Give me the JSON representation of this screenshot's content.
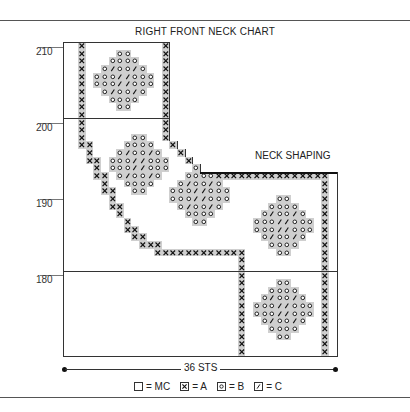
{
  "title": "RIGHT FRONT NECK CHART",
  "annotation": "NECK SHAPING",
  "width_label": "36 STS",
  "y_axis": {
    "labels": [
      {
        "value": "210",
        "y": 49
      },
      {
        "value": "200",
        "y": 125
      },
      {
        "value": "190",
        "y": 201
      },
      {
        "value": "180",
        "y": 277
      }
    ]
  },
  "legend": [
    {
      "symbol": "MC",
      "text": "= MC"
    },
    {
      "symbol": "A",
      "text": "= A"
    },
    {
      "symbol": "B",
      "text": "= B"
    },
    {
      "symbol": "C",
      "text": "= C"
    }
  ],
  "grid": {
    "columns": 36,
    "rows": 41,
    "cell_w": 7.6,
    "cell_h": 7.65,
    "row_widths": [
      14,
      14,
      14,
      14,
      14,
      14,
      14,
      14,
      14,
      14,
      14,
      14,
      14,
      15,
      16,
      17,
      18,
      36,
      36,
      36,
      36,
      36,
      36,
      36,
      36,
      36,
      36,
      36,
      36,
      36,
      36,
      36,
      36,
      36,
      36,
      36,
      36,
      36,
      36,
      36,
      36
    ],
    "a_cells": [
      [
        0,
        2
      ],
      [
        1,
        2
      ],
      [
        2,
        2
      ],
      [
        3,
        2
      ],
      [
        4,
        2
      ],
      [
        5,
        2
      ],
      [
        6,
        2
      ],
      [
        7,
        2
      ],
      [
        8,
        2
      ],
      [
        9,
        2
      ],
      [
        10,
        2
      ],
      [
        11,
        2
      ],
      [
        12,
        2
      ],
      [
        13,
        2
      ],
      [
        13,
        3
      ],
      [
        14,
        3
      ],
      [
        15,
        3
      ],
      [
        15,
        4
      ],
      [
        16,
        4
      ],
      [
        17,
        4
      ],
      [
        17,
        5
      ],
      [
        18,
        5
      ],
      [
        19,
        5
      ],
      [
        19,
        6
      ],
      [
        20,
        6
      ],
      [
        21,
        6
      ],
      [
        21,
        7
      ],
      [
        22,
        7
      ],
      [
        23,
        8
      ],
      [
        24,
        8
      ],
      [
        24,
        9
      ],
      [
        25,
        9
      ],
      [
        25,
        10
      ],
      [
        26,
        10
      ],
      [
        26,
        11
      ],
      [
        26,
        12
      ],
      [
        27,
        12
      ],
      [
        27,
        13
      ],
      [
        27,
        14
      ],
      [
        27,
        15
      ],
      [
        27,
        16
      ],
      [
        27,
        17
      ],
      [
        27,
        18
      ],
      [
        27,
        19
      ],
      [
        27,
        20
      ],
      [
        27,
        21
      ],
      [
        27,
        22
      ],
      [
        27,
        23
      ],
      [
        28,
        23
      ],
      [
        29,
        23
      ],
      [
        30,
        23
      ],
      [
        31,
        23
      ],
      [
        32,
        23
      ],
      [
        33,
        23
      ],
      [
        34,
        23
      ],
      [
        35,
        23
      ],
      [
        36,
        23
      ],
      [
        37,
        23
      ],
      [
        38,
        23
      ],
      [
        39,
        23
      ],
      [
        40,
        23
      ],
      [
        0,
        13
      ],
      [
        1,
        13
      ],
      [
        2,
        13
      ],
      [
        3,
        13
      ],
      [
        4,
        13
      ],
      [
        5,
        13
      ],
      [
        6,
        13
      ],
      [
        7,
        13
      ],
      [
        8,
        13
      ],
      [
        9,
        13
      ],
      [
        10,
        13
      ],
      [
        11,
        13
      ],
      [
        12,
        13
      ],
      [
        12,
        14
      ],
      [
        13,
        14
      ],
      [
        13,
        15
      ],
      [
        14,
        15
      ],
      [
        14,
        16
      ],
      [
        15,
        16
      ],
      [
        15,
        17
      ],
      [
        16,
        17
      ],
      [
        16,
        18
      ],
      [
        17,
        18
      ],
      [
        17,
        19
      ],
      [
        17,
        20
      ],
      [
        17,
        21
      ],
      [
        17,
        22
      ],
      [
        17,
        23
      ],
      [
        17,
        24
      ],
      [
        17,
        25
      ],
      [
        17,
        26
      ],
      [
        17,
        27
      ],
      [
        17,
        28
      ],
      [
        17,
        29
      ],
      [
        17,
        30
      ],
      [
        17,
        31
      ],
      [
        17,
        32
      ],
      [
        17,
        33
      ],
      [
        17,
        34
      ],
      [
        18,
        34
      ],
      [
        19,
        34
      ],
      [
        20,
        34
      ],
      [
        21,
        34
      ],
      [
        22,
        34
      ],
      [
        23,
        34
      ],
      [
        24,
        34
      ],
      [
        25,
        34
      ],
      [
        26,
        34
      ],
      [
        27,
        34
      ],
      [
        28,
        34
      ],
      [
        29,
        34
      ],
      [
        30,
        34
      ],
      [
        31,
        34
      ],
      [
        32,
        34
      ],
      [
        33,
        34
      ],
      [
        34,
        34
      ],
      [
        35,
        34
      ],
      [
        36,
        34
      ],
      [
        37,
        34
      ],
      [
        38,
        34
      ],
      [
        39,
        34
      ],
      [
        40,
        34
      ]
    ],
    "motifs": [
      {
        "top": 1,
        "left": 4
      },
      {
        "top": 12,
        "left": 6
      },
      {
        "top": 16,
        "left": 14
      },
      {
        "top": 20,
        "left": 25
      },
      {
        "top": 31,
        "left": 25
      }
    ],
    "motif_pattern": [
      "...BB...",
      "..BBBB..",
      ".BCBBCB.",
      "BBBCCBBB",
      "BBBCCBBB",
      ".BCBBCB.",
      "..BBBB..",
      "...BB..."
    ]
  }
}
